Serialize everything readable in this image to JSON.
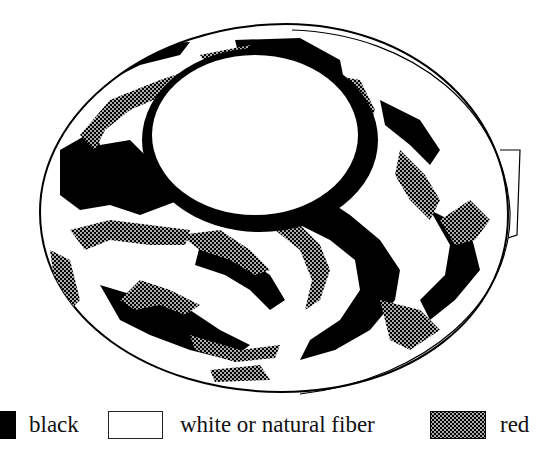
{
  "figure": {
    "colors": {
      "black": "#000000",
      "white": "#ffffff",
      "red_pattern": "#000000"
    }
  },
  "legend": {
    "items": [
      {
        "key": "black",
        "label": "black",
        "swatch": "solid-black"
      },
      {
        "key": "white",
        "label": "white or natural fiber",
        "swatch": "outlined-white"
      },
      {
        "key": "red",
        "label": "red",
        "swatch": "crosshatch"
      }
    ]
  }
}
